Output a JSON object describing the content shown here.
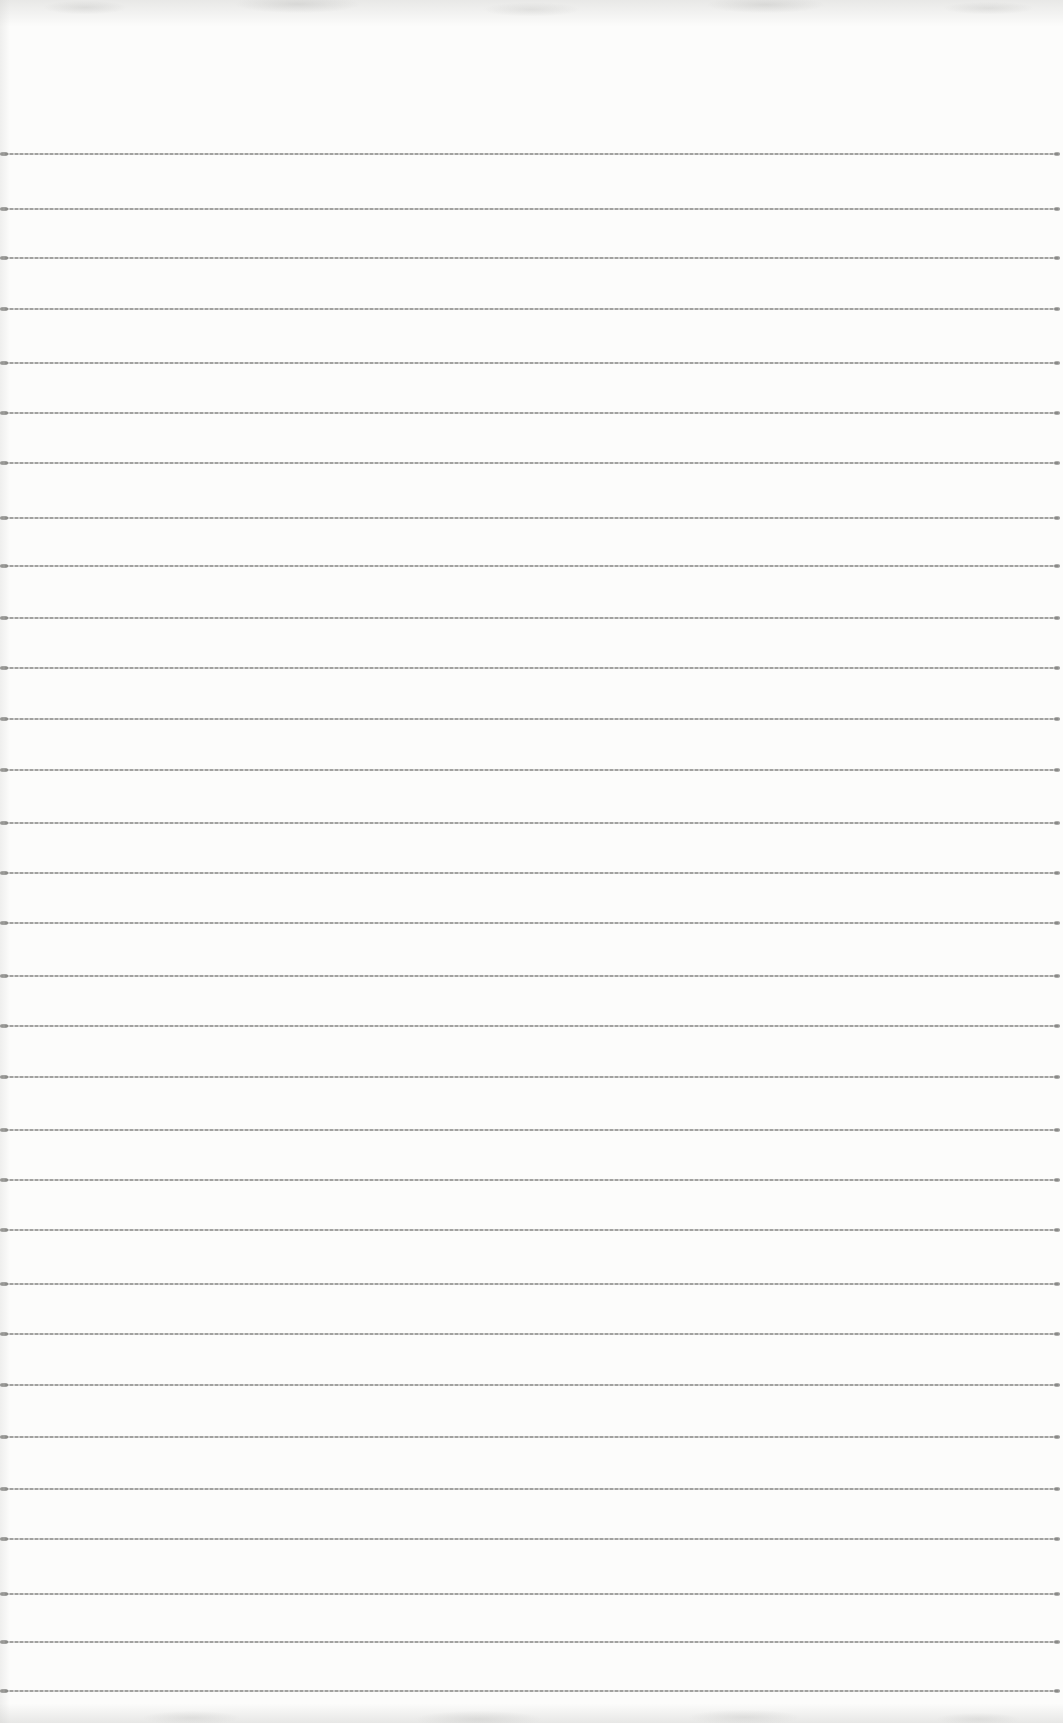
{
  "document": {
    "kind": "blank ruled notebook page (scanned, no writing)",
    "text_content": "",
    "ruling": {
      "line_count": 31,
      "line_positions_px": [
        153,
        208,
        257,
        308,
        362,
        412,
        462,
        517,
        565,
        617,
        667,
        718,
        769,
        822,
        872,
        922,
        975,
        1025,
        1076,
        1129,
        1179,
        1229,
        1283,
        1333,
        1384,
        1436,
        1488,
        1538,
        1593,
        1641,
        1690
      ],
      "line_thickness_px": 2,
      "line_color": "#8e8e8c"
    },
    "page": {
      "width_px": 1063,
      "height_px": 1723,
      "paper_color": "#fcfcfb",
      "edge_shadow_color": "#cacac8"
    }
  }
}
